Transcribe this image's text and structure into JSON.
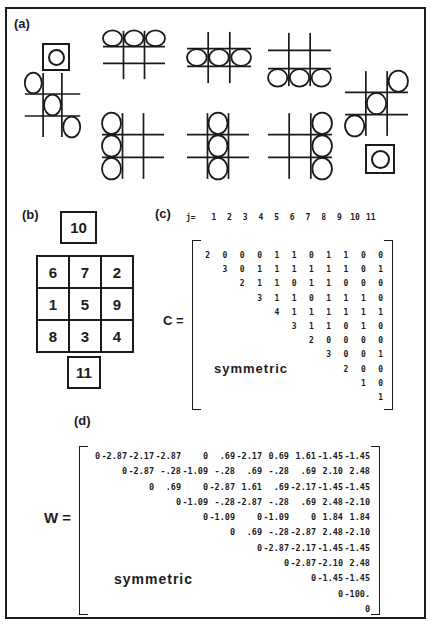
{
  "figure": {
    "ink": "#1a1a1a",
    "background": "#ffffff"
  },
  "panels": {
    "a": {
      "label": "(a)"
    },
    "b": {
      "label": "(b)"
    },
    "c": {
      "label": "(c)"
    },
    "d": {
      "label": "(d)"
    }
  },
  "panel_a": {
    "description": "eight tic-tac-toe winning lines shown as circles, plus two boxed single circles",
    "boards": [
      {
        "name": "win-diagonal-main",
        "cells": [
          [
            0,
            0
          ],
          [
            1,
            1
          ],
          [
            2,
            2
          ]
        ],
        "left": 23,
        "top": 72,
        "width": 59,
        "height": 66
      },
      {
        "name": "win-row-top",
        "cells": [
          [
            0,
            0
          ],
          [
            0,
            1
          ],
          [
            0,
            2
          ]
        ],
        "left": 101,
        "top": 30,
        "width": 66,
        "height": 50
      },
      {
        "name": "win-row-middle",
        "cells": [
          [
            1,
            0
          ],
          [
            1,
            1
          ],
          [
            1,
            2
          ]
        ],
        "left": 185,
        "top": 31,
        "width": 68,
        "height": 53
      },
      {
        "name": "win-row-bottom",
        "cells": [
          [
            2,
            0
          ],
          [
            2,
            1
          ],
          [
            2,
            2
          ]
        ],
        "left": 266,
        "top": 32,
        "width": 67,
        "height": 55
      },
      {
        "name": "win-diagonal-anti",
        "cells": [
          [
            0,
            2
          ],
          [
            1,
            1
          ],
          [
            2,
            0
          ]
        ],
        "left": 343,
        "top": 70,
        "width": 67,
        "height": 67
      },
      {
        "name": "win-col-left",
        "cells": [
          [
            0,
            0
          ],
          [
            1,
            0
          ],
          [
            2,
            0
          ]
        ],
        "left": 100,
        "top": 112,
        "width": 66,
        "height": 68
      },
      {
        "name": "win-col-middle",
        "cells": [
          [
            0,
            1
          ],
          [
            1,
            1
          ],
          [
            2,
            1
          ]
        ],
        "left": 185,
        "top": 112,
        "width": 66,
        "height": 68
      },
      {
        "name": "win-col-right",
        "cells": [
          [
            0,
            2
          ],
          [
            1,
            2
          ],
          [
            2,
            2
          ]
        ],
        "left": 266,
        "top": 112,
        "width": 68,
        "height": 68
      }
    ],
    "boxed_circles": [
      {
        "name": "boxed-circle-left",
        "left": 42,
        "top": 43,
        "size": 24
      },
      {
        "name": "boxed-circle-right",
        "left": 365,
        "top": 144,
        "size": 26
      }
    ]
  },
  "panel_b": {
    "top_box": "10",
    "bottom_box": "11",
    "grid": [
      [
        "6",
        "7",
        "2"
      ],
      [
        "1",
        "5",
        "9"
      ],
      [
        "8",
        "3",
        "4"
      ]
    ]
  },
  "panel_c": {
    "header_prefix": "j=",
    "header": [
      "1",
      "2",
      "3",
      "4",
      "5",
      "6",
      "7",
      "8",
      "9",
      "10",
      "11"
    ],
    "label": "C =",
    "symmetric": "symmetric",
    "rows": [
      {
        "start_col": 1,
        "values": [
          "2",
          "0",
          "0",
          "0",
          "1",
          "1",
          "0",
          "1",
          "1",
          "0",
          "0"
        ]
      },
      {
        "start_col": 2,
        "values": [
          "3",
          "0",
          "1",
          "1",
          "1",
          "1",
          "1",
          "1",
          "0",
          "1"
        ]
      },
      {
        "start_col": 3,
        "values": [
          "2",
          "1",
          "1",
          "0",
          "1",
          "1",
          "0",
          "0",
          "0"
        ]
      },
      {
        "start_col": 4,
        "values": [
          "3",
          "1",
          "1",
          "0",
          "1",
          "1",
          "1",
          "0"
        ]
      },
      {
        "start_col": 5,
        "values": [
          "4",
          "1",
          "1",
          "1",
          "1",
          "1",
          "1"
        ]
      },
      {
        "start_col": 6,
        "values": [
          "3",
          "1",
          "1",
          "0",
          "1",
          "0"
        ]
      },
      {
        "start_col": 7,
        "values": [
          "2",
          "0",
          "0",
          "0",
          "0"
        ]
      },
      {
        "start_col": 8,
        "values": [
          "3",
          "0",
          "0",
          "1"
        ]
      },
      {
        "start_col": 9,
        "values": [
          "2",
          "0",
          "0"
        ]
      },
      {
        "start_col": 10,
        "values": [
          "1",
          "0"
        ]
      },
      {
        "start_col": 11,
        "values": [
          "1"
        ]
      }
    ]
  },
  "panel_d": {
    "label": "W =",
    "symmetric": "symmetric",
    "rows": [
      {
        "start_col": 1,
        "values": [
          "0",
          "-2.87",
          "-2.17",
          "-2.87",
          "0",
          ".69",
          "-2.17",
          "0.69",
          "1.61",
          "-1.45",
          "-1.45"
        ]
      },
      {
        "start_col": 2,
        "values": [
          "0",
          "-2.87",
          "-.28",
          "-1.09",
          "-.28",
          ".69",
          "-.28",
          ".69",
          "2.10",
          "2.48"
        ]
      },
      {
        "start_col": 3,
        "values": [
          "0",
          ".69",
          "0",
          "-2.87",
          "1.61",
          ".69",
          "-2.17",
          "-1.45",
          "-1.45"
        ]
      },
      {
        "start_col": 4,
        "values": [
          "0",
          "-1.09",
          "-.28",
          "-2.87",
          "-.28",
          ".69",
          "2.48",
          "-2.10"
        ]
      },
      {
        "start_col": 5,
        "values": [
          "0",
          "-1.09",
          "0",
          "-1.09",
          "0",
          "1.84",
          "1.84"
        ]
      },
      {
        "start_col": 6,
        "values": [
          "0",
          ".69",
          "-.28",
          "-2.87",
          "2.48",
          "-2.10"
        ]
      },
      {
        "start_col": 7,
        "values": [
          "0",
          "-2.87",
          "-2.17",
          "-1.45",
          "-1.45"
        ]
      },
      {
        "start_col": 8,
        "values": [
          "0",
          "-2.87",
          "-2.10",
          "2.48"
        ]
      },
      {
        "start_col": 9,
        "values": [
          "0",
          "-1.45",
          "-1.45"
        ]
      },
      {
        "start_col": 10,
        "values": [
          "0",
          "-100."
        ]
      },
      {
        "start_col": 11,
        "values": [
          "0"
        ]
      }
    ]
  }
}
